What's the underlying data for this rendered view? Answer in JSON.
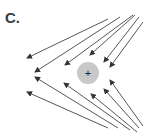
{
  "panel": {
    "label": "C."
  },
  "charge": {
    "symbol": "+",
    "cx": 88,
    "cy": 73,
    "r": 11,
    "fill": "#c8c8c8"
  },
  "arrow_color": "#444444",
  "arrows": [
    {
      "x1": 108,
      "y1": 19,
      "x2": 27,
      "y2": 58
    },
    {
      "x1": 120,
      "y1": 17,
      "x2": 35,
      "y2": 72
    },
    {
      "x1": 133,
      "y1": 15,
      "x2": 65,
      "y2": 65
    },
    {
      "x1": 135,
      "y1": 15,
      "x2": 90,
      "y2": 55
    },
    {
      "x1": 139,
      "y1": 17,
      "x2": 104,
      "y2": 62
    },
    {
      "x1": 143,
      "y1": 22,
      "x2": 110,
      "y2": 67
    },
    {
      "x1": 108,
      "y1": 128,
      "x2": 27,
      "y2": 92
    },
    {
      "x1": 118,
      "y1": 128,
      "x2": 35,
      "y2": 77
    },
    {
      "x1": 130,
      "y1": 130,
      "x2": 64,
      "y2": 83
    },
    {
      "x1": 137,
      "y1": 132,
      "x2": 91,
      "y2": 94
    },
    {
      "x1": 139,
      "y1": 128,
      "x2": 104,
      "y2": 89
    },
    {
      "x1": 143,
      "y1": 126,
      "x2": 110,
      "y2": 80
    }
  ]
}
